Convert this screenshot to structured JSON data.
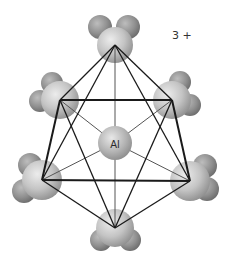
{
  "diagram": {
    "charge": "3 +",
    "central_atom": {
      "label": "Al",
      "x": 115,
      "y": 143,
      "r": 17
    },
    "ligands": [
      {
        "name": "water-top",
        "o": [
          115,
          45
        ],
        "h": [
          [
            100,
            27
          ],
          [
            128,
            27
          ]
        ],
        "o_r": 18,
        "h_r": 12
      },
      {
        "name": "water-upper-left",
        "o": [
          60,
          100
        ],
        "h": [
          [
            52,
            83
          ],
          [
            40,
            101
          ]
        ],
        "o_r": 19,
        "h_r": 11
      },
      {
        "name": "water-upper-right",
        "o": [
          172,
          100
        ],
        "h": [
          [
            180,
            82
          ],
          [
            190,
            105
          ]
        ],
        "o_r": 19,
        "h_r": 11
      },
      {
        "name": "water-lower-left",
        "o": [
          42,
          180
        ],
        "h": [
          [
            30,
            165
          ],
          [
            24,
            191
          ]
        ],
        "o_r": 20,
        "h_r": 12
      },
      {
        "name": "water-lower-right",
        "o": [
          190,
          181
        ],
        "h": [
          [
            205,
            166
          ],
          [
            207,
            189
          ]
        ],
        "o_r": 20,
        "h_r": 12
      },
      {
        "name": "water-bottom",
        "o": [
          115,
          228
        ],
        "h": [
          [
            101,
            240
          ],
          [
            130,
            240
          ]
        ],
        "o_r": 19,
        "h_r": 11
      }
    ],
    "colors": {
      "oxygen_light": "#e2e2e2",
      "oxygen_dark": "#8e8e8e",
      "hydrogen_light": "#b5b5b5",
      "hydrogen_dark": "#6a6a6a",
      "edge": "#1a1a1a",
      "spoke": "#555555"
    }
  }
}
